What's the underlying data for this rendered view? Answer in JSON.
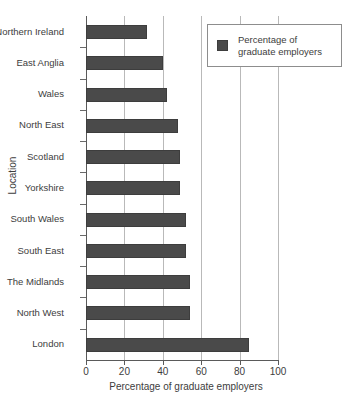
{
  "chart_data": {
    "type": "bar",
    "orientation": "horizontal",
    "title": "",
    "xlabel": "Percentage of graduate employers",
    "ylabel": "Location",
    "xlim": [
      0,
      100
    ],
    "xticks": [
      0,
      20,
      40,
      60,
      80,
      100
    ],
    "xtick_labels": [
      "0",
      "20",
      "40",
      "60",
      "80",
      "100"
    ],
    "grid": "vertical",
    "legend_position": "top-right",
    "bar_color": "#4a4a4a",
    "categories": [
      "Northern Ireland",
      "East Anglia",
      "Wales",
      "North East",
      "Scotland",
      "Yorkshire",
      "South Wales",
      "South East",
      "The Midlands",
      "North West",
      "London"
    ],
    "series": [
      {
        "name": "Percentage of graduate employers",
        "values": [
          32,
          40,
          42,
          48,
          49,
          49,
          52,
          52,
          54,
          54,
          85
        ]
      }
    ],
    "legend": [
      {
        "label_line1": "Percentage of",
        "label_line2": "graduate employers",
        "color": "#4a4a4a"
      }
    ]
  },
  "page": {
    "bleed_text": ""
  }
}
